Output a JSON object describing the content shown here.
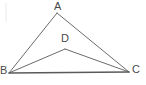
{
  "figure": {
    "background_color": "#ffffff",
    "stroke_color": "#6b6b6b",
    "base_stroke_color": "#5a5a5a",
    "label_color": "#4a4a4a",
    "stroke_width": 1,
    "base_stroke_width": 1.4,
    "canvas": {
      "width": 146,
      "height": 85
    }
  },
  "points": {
    "A": {
      "label": "A",
      "x": 57,
      "y": 13
    },
    "B": {
      "label": "B",
      "x": 9,
      "y": 73
    },
    "C": {
      "label": "C",
      "x": 129,
      "y": 72
    },
    "D": {
      "label": "D",
      "x": 65,
      "y": 49
    }
  },
  "segments": [
    {
      "name": "AB",
      "from": "A",
      "to": "B",
      "x1": 57,
      "y1": 13,
      "x2": 9,
      "y2": 73
    },
    {
      "name": "AC",
      "from": "A",
      "to": "C",
      "x1": 57,
      "y1": 13,
      "x2": 129,
      "y2": 72
    },
    {
      "name": "BC",
      "from": "B",
      "to": "C",
      "x1": 9,
      "y1": 73,
      "x2": 129,
      "y2": 72
    },
    {
      "name": "DB",
      "from": "D",
      "to": "B",
      "x1": 65,
      "y1": 49,
      "x2": 9,
      "y2": 73
    },
    {
      "name": "DC",
      "from": "D",
      "to": "C",
      "x1": 65,
      "y1": 49,
      "x2": 129,
      "y2": 72
    }
  ],
  "artifact": {
    "name": "left-edge-line",
    "color": "#ececec",
    "x": 6,
    "y1": 3,
    "y2": 22
  }
}
